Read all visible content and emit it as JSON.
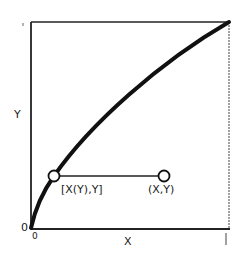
{
  "diagram": {
    "type": "function-plot-schematic",
    "axes": {
      "x_label": "X",
      "y_label": "Y",
      "x_origin_label": "0",
      "y_origin_label": "0",
      "x_max_label": "1",
      "y_max_label": "1"
    },
    "curve": {
      "description": "concave increasing curve from (0,0) to (1,1)",
      "color": "#111111"
    },
    "points": [
      {
        "id": "curve-point",
        "label": "[X(Y),Y]"
      },
      {
        "id": "free-point",
        "label": "(X,Y)"
      }
    ],
    "connector": "horizontal line joining [X(Y),Y] and (X,Y)"
  }
}
